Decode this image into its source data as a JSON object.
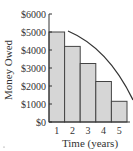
{
  "chart_data": {
    "type": "bar",
    "title": "",
    "xlabel": "Time (years)",
    "ylabel": "Money Owed",
    "categories": [
      "1",
      "2",
      "3",
      "4",
      "5"
    ],
    "values": [
      5000,
      4200,
      3250,
      2250,
      1150
    ],
    "ylim": [
      0,
      6000
    ],
    "yticks": [
      "$0",
      "$1000",
      "$2000",
      "$3000",
      "$4000",
      "$5000",
      "$6000"
    ],
    "ytick_values": [
      0,
      1000,
      2000,
      3000,
      4000,
      5000,
      6000
    ],
    "grid": false,
    "legend": null,
    "annotations": [
      {
        "type": "curve",
        "description": "decreasing concave-down curve from top of bar 2 (~$5000) down to ~$1200 at x=5"
      }
    ],
    "colors": {
      "bar_fill": "#d6d6d6",
      "bar_stroke": "#444444",
      "axis": "#333333"
    }
  }
}
